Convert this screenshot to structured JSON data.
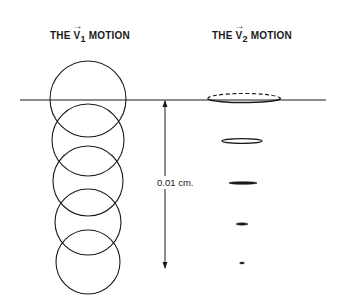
{
  "titles": {
    "left": {
      "prefix": "THE ",
      "vector": "V",
      "subscript": "1",
      "arrow": "→",
      "suffix": " MOTION"
    },
    "right": {
      "prefix": "THE ",
      "vector": "V",
      "subscript": "2",
      "arrow": "→",
      "suffix": " MOTION"
    }
  },
  "scale": {
    "label": "0.01 cm."
  },
  "colors": {
    "ink": "#1a1a1a",
    "background": "#ffffff"
  },
  "v1_circles": [
    {
      "cx": 88,
      "cy": 99,
      "r": 38
    },
    {
      "cx": 88,
      "cy": 140,
      "r": 36
    },
    {
      "cx": 88,
      "cy": 181,
      "r": 35
    },
    {
      "cx": 88,
      "cy": 222,
      "r": 33
    },
    {
      "cx": 88,
      "cy": 262,
      "r": 32
    }
  ],
  "v2_ellipses": [
    {
      "cx": 244,
      "cy": 98,
      "rx": 36,
      "ry": 4.5,
      "style": "dashed-top"
    },
    {
      "cx": 242,
      "cy": 141,
      "rx": 20,
      "ry": 2.5,
      "style": "open"
    },
    {
      "cx": 243,
      "cy": 183,
      "rx": 14,
      "ry": 1.3,
      "style": "filled"
    },
    {
      "cx": 242,
      "cy": 224,
      "rx": 6,
      "ry": 1.2,
      "style": "filled"
    },
    {
      "cx": 242,
      "cy": 263,
      "rx": 2.5,
      "ry": 1,
      "style": "filled"
    }
  ]
}
